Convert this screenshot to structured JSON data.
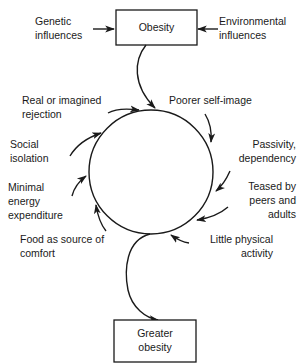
{
  "diagram": {
    "type": "cycle-flow",
    "top_box": {
      "label": "Obesity"
    },
    "bottom_box": {
      "label_line1": "Greater",
      "label_line2": "obesity"
    },
    "inputs": {
      "left": {
        "line1": "Genetic",
        "line2": "influences"
      },
      "right": {
        "line1": "Environmental",
        "line2": "influences"
      }
    },
    "cycle_factors": [
      {
        "id": "poorer-self-image",
        "line1": "Poorer self-image",
        "line2": ""
      },
      {
        "id": "passivity-dependency",
        "line1": "Passivity,",
        "line2": "dependency"
      },
      {
        "id": "teased",
        "line1": "Teased by",
        "line2": "peers and",
        "line3": "adults"
      },
      {
        "id": "little-physical-activity",
        "line1": "Little physical",
        "line2": "activity"
      },
      {
        "id": "food-comfort",
        "line1": "Food as source of",
        "line2": "comfort"
      },
      {
        "id": "minimal-energy",
        "line1": "Minimal",
        "line2": "energy",
        "line3": "expenditure"
      },
      {
        "id": "social-isolation",
        "line1": "Social",
        "line2": "isolation"
      },
      {
        "id": "rejection",
        "line1": "Real or imagined",
        "line2": "rejection"
      }
    ],
    "colors": {
      "ink": "#1a1a1a",
      "background": "#ffffff"
    }
  }
}
